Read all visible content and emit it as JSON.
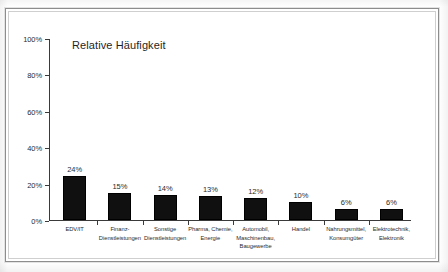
{
  "chart_data": {
    "type": "bar",
    "title": "Relative Häufigkeit",
    "xlabel": "",
    "ylabel": "",
    "ylim": [
      0,
      100
    ],
    "grid": false,
    "legend": "none",
    "y_ticks": [
      "0%",
      "20%",
      "40%",
      "60%",
      "80%",
      "100%"
    ],
    "y_tick_values": [
      0,
      20,
      40,
      60,
      80,
      100
    ],
    "categories": [
      "EDV/IT",
      "Finanz-Dienstleistungen",
      "Sonstige Dienstleistungen",
      "Pharma, Chemie, Energie",
      "Automobil, Maschinenbau, Baugewerbe",
      "Handel",
      "Nahrungsmittel, Konsumgüter",
      "Elektrotechnik, Elektronik"
    ],
    "category_lines": [
      [
        "EDV/IT"
      ],
      [
        "Finanz-",
        "Dienstleistungen"
      ],
      [
        "Sonstige",
        "Dienstleistungen"
      ],
      [
        "Pharma, Chemie,",
        "Energie"
      ],
      [
        "Automobil,",
        "Maschinenbau,",
        "Baugewerbe"
      ],
      [
        "Handel"
      ],
      [
        "Nahrungsmittel,",
        "Konsumgüter"
      ],
      [
        "Elektrotechnik,",
        "Elektronik"
      ]
    ],
    "values": [
      24,
      15,
      14,
      13,
      12,
      10,
      6,
      6
    ],
    "value_labels": [
      "24%",
      "15%",
      "14%",
      "13%",
      "12%",
      "10%",
      "6%",
      "6%"
    ],
    "bar_color": "#101010",
    "axis_color": "#3a3a3a",
    "background_color": "#ffffff"
  }
}
